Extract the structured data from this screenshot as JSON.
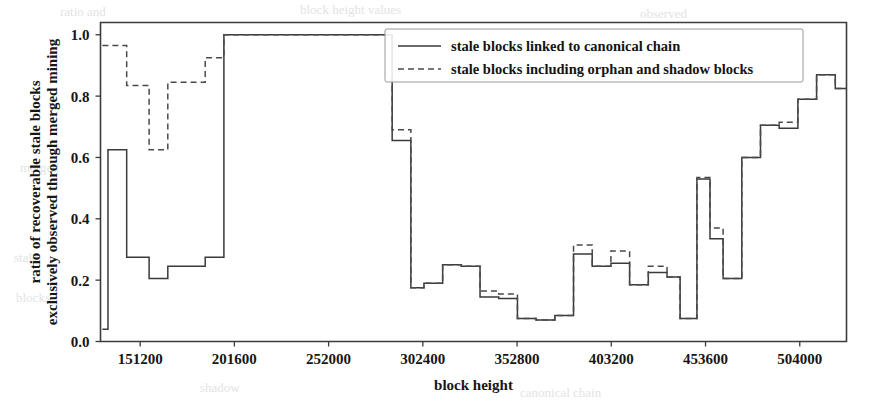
{
  "chart_data": {
    "type": "line",
    "title": "",
    "xlabel": "block height",
    "ylabel": "ratio of recoverable stale blocks\nexclusively observed through merged mining",
    "ylabel_line1": "ratio of recoverable stale blocks",
    "ylabel_line2": "exclusively observed through merged mining",
    "xlim": [
      130000,
      529000
    ],
    "ylim": [
      0.0,
      1.04
    ],
    "xticks": [
      151200,
      201600,
      252000,
      302400,
      352800,
      403200,
      453600,
      504000
    ],
    "xticklabels": [
      "151200",
      "201600",
      "252000",
      "302400",
      "352800",
      "403200",
      "453600",
      "504000"
    ],
    "yticks": [
      0.0,
      0.2,
      0.4,
      0.6,
      0.8,
      1.0
    ],
    "yticklabels": [
      "0.0",
      "0.2",
      "0.4",
      "0.6",
      "0.8",
      "1.0"
    ],
    "grid": false,
    "drawstyle": "steps-post",
    "legend_position": "upper right",
    "series": [
      {
        "name": "stale blocks linked to canonical chain",
        "style": "solid",
        "color": "#3a3a3a",
        "x": [
          131000,
          134000,
          144000,
          156000,
          166000,
          176000,
          186000,
          196000,
          206000,
          286000,
          296000,
          303000,
          313000,
          323000,
          333000,
          343000,
          353000,
          363000,
          373000,
          383000,
          393000,
          403000,
          413000,
          423000,
          433000,
          440000,
          449000,
          456000,
          463000,
          473000,
          483000,
          493000,
          503000,
          513000,
          523000,
          529000
        ],
        "values": [
          0.04,
          0.625,
          0.275,
          0.205,
          0.245,
          0.245,
          0.275,
          1.0,
          1.0,
          0.655,
          0.175,
          0.19,
          0.25,
          0.245,
          0.145,
          0.14,
          0.075,
          0.07,
          0.085,
          0.285,
          0.245,
          0.255,
          0.185,
          0.225,
          0.21,
          0.075,
          0.53,
          0.335,
          0.205,
          0.6,
          0.705,
          0.695,
          0.79,
          0.87,
          0.825,
          0.825
        ]
      },
      {
        "name": "stale blocks including orphan and shadow blocks",
        "style": "dashed",
        "color": "#4a4a4a",
        "x": [
          131000,
          134000,
          144000,
          156000,
          166000,
          176000,
          186000,
          196000,
          206000,
          286000,
          296000,
          303000,
          313000,
          323000,
          333000,
          343000,
          353000,
          363000,
          373000,
          383000,
          393000,
          403000,
          413000,
          423000,
          433000,
          440000,
          449000,
          456000,
          463000,
          473000,
          483000,
          493000,
          503000,
          513000,
          523000,
          529000
        ],
        "values": [
          0.965,
          0.965,
          0.835,
          0.625,
          0.845,
          0.845,
          0.925,
          1.0,
          1.0,
          0.69,
          0.175,
          0.19,
          0.25,
          0.245,
          0.165,
          0.155,
          0.075,
          0.07,
          0.085,
          0.315,
          0.245,
          0.295,
          0.185,
          0.245,
          0.21,
          0.075,
          0.535,
          0.37,
          0.205,
          0.6,
          0.705,
          0.715,
          0.79,
          0.87,
          0.825,
          0.825
        ]
      }
    ]
  },
  "legend": {
    "entries": [
      {
        "label": "stale blocks linked to canonical chain",
        "style": "solid"
      },
      {
        "label": "stale blocks including orphan and shadow blocks",
        "style": "dashed"
      }
    ]
  },
  "background_artifacts": [
    {
      "text": "ratio and",
      "x": 60,
      "y": 4
    },
    {
      "text": "block height values",
      "x": 300,
      "y": 2
    },
    {
      "text": "observed",
      "x": 640,
      "y": 6
    },
    {
      "text": "merged",
      "x": 20,
      "y": 160
    },
    {
      "text": "stale",
      "x": 14,
      "y": 250
    },
    {
      "text": "blocks",
      "x": 16,
      "y": 290
    },
    {
      "text": "shadow",
      "x": 200,
      "y": 380
    },
    {
      "text": "canonical chain",
      "x": 520,
      "y": 385
    }
  ]
}
